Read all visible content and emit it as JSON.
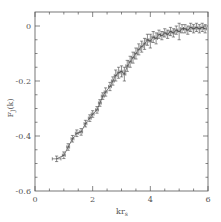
{
  "chart_data": {
    "type": "line",
    "title": "",
    "xlabel": "kr_s",
    "ylabel": "F_J(k)",
    "xlim": [
      0,
      6
    ],
    "ylim": [
      -0.6,
      0.03
    ],
    "grid": false,
    "legend": null,
    "x_ticks": [
      0,
      2,
      4,
      6
    ],
    "x_tick_labels": [
      "0",
      "2",
      "4",
      "6"
    ],
    "y_ticks": [
      0,
      -0.2,
      -0.4,
      -0.6
    ],
    "y_tick_labels": [
      "0",
      "-0.2",
      "-0.4",
      "-0.6"
    ],
    "series": [
      {
        "name": "F_J(k)",
        "style": "line with error bars",
        "x": [
          0.75,
          1.0,
          1.15,
          1.3,
          1.45,
          1.6,
          1.75,
          1.9,
          2.0,
          2.15,
          2.25,
          2.35,
          2.45,
          2.6,
          2.7,
          2.8,
          2.9,
          3.0,
          3.1,
          3.2,
          3.3,
          3.4,
          3.5,
          3.6,
          3.7,
          3.8,
          3.9,
          4.0,
          4.1,
          4.2,
          4.3,
          4.4,
          4.5,
          4.6,
          4.7,
          4.8,
          4.9,
          5.0,
          5.1,
          5.2,
          5.3,
          5.4,
          5.5,
          5.6,
          5.7,
          5.8,
          5.9
        ],
        "y": [
          -0.483,
          -0.47,
          -0.44,
          -0.41,
          -0.39,
          -0.385,
          -0.355,
          -0.335,
          -0.32,
          -0.305,
          -0.28,
          -0.255,
          -0.24,
          -0.22,
          -0.2,
          -0.18,
          -0.17,
          -0.165,
          -0.175,
          -0.145,
          -0.13,
          -0.115,
          -0.1,
          -0.085,
          -0.075,
          -0.065,
          -0.05,
          -0.055,
          -0.04,
          -0.045,
          -0.03,
          -0.035,
          -0.025,
          -0.03,
          -0.02,
          -0.025,
          -0.015,
          -0.02,
          -0.01,
          -0.01,
          -0.015,
          -0.005,
          -0.01,
          -0.005,
          -0.01,
          -0.005,
          -0.01
        ],
        "yerr": [
          0.01,
          0.012,
          0.012,
          0.012,
          0.012,
          0.012,
          0.012,
          0.012,
          0.012,
          0.012,
          0.012,
          0.012,
          0.015,
          0.015,
          0.015,
          0.02,
          0.02,
          0.02,
          0.025,
          0.02,
          0.02,
          0.02,
          0.02,
          0.02,
          0.02,
          0.02,
          0.02,
          0.025,
          0.02,
          0.02,
          0.015,
          0.015,
          0.015,
          0.015,
          0.015,
          0.015,
          0.015,
          0.03,
          0.015,
          0.015,
          0.015,
          0.015,
          0.015,
          0.015,
          0.015,
          0.015,
          0.015
        ],
        "xerr": [
          0.15,
          0.05,
          0.05,
          0.05,
          0.05,
          0.05,
          0.05,
          0.05,
          0.05,
          0.05,
          0.05,
          0.05,
          0.05,
          0.05,
          0.05,
          0.05,
          0.05,
          0.05,
          0.05,
          0.05,
          0.05,
          0.05,
          0.05,
          0.05,
          0.05,
          0.05,
          0.05,
          0.05,
          0.05,
          0.05,
          0.05,
          0.05,
          0.05,
          0.05,
          0.05,
          0.05,
          0.05,
          0.05,
          0.05,
          0.05,
          0.05,
          0.05,
          0.05,
          0.05,
          0.05,
          0.05,
          0.05
        ]
      }
    ]
  },
  "colors": {
    "axis": "#555555",
    "line": "#444444",
    "background": "#ffffff"
  }
}
